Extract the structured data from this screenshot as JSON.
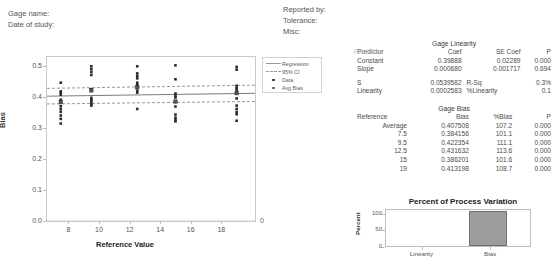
{
  "header": {
    "left": [
      "Gage name:",
      "Date of study:"
    ],
    "right": [
      "Reported by:",
      "Tolerance:",
      "Misc:"
    ]
  },
  "legend": {
    "items": [
      {
        "label": "Regression",
        "key": "solid-line"
      },
      {
        "label": "95% CI",
        "key": "dashed-line"
      },
      {
        "label": "Data",
        "key": "dot-marker"
      },
      {
        "label": "Avg Bias",
        "key": "square-marker"
      }
    ]
  },
  "linearity_table": {
    "title": "Gage Linearity",
    "headers": [
      "Predictor",
      "Coef",
      "SE Coef",
      "P"
    ],
    "rows": [
      [
        "Constant",
        "0.39888",
        "0.02289",
        "0.000"
      ],
      [
        "Slope",
        "0.000680",
        "0.001717",
        "0.694"
      ]
    ],
    "summary": [
      [
        "S",
        "0.0539582",
        "R-Sq",
        "0.3%"
      ],
      [
        "Linearity",
        "0.0002583",
        "%Linearity",
        "0.1"
      ]
    ]
  },
  "bias_table": {
    "title": "Gage Bias",
    "headers": [
      "Reference",
      "Bias",
      "%Bias",
      "P"
    ],
    "rows": [
      [
        "Average",
        "0.407508",
        "107.2",
        "0.000"
      ],
      [
        "7.5",
        "0.384156",
        "101.1",
        "0.000"
      ],
      [
        "9.5",
        "0.422354",
        "111.1",
        "0.000"
      ],
      [
        "12.5",
        "0.431632",
        "113.6",
        "0.000"
      ],
      [
        "15",
        "0.386201",
        "101.6",
        "0.000"
      ],
      [
        "19",
        "0.413198",
        "108.7",
        "0.000"
      ]
    ]
  },
  "chart_data": [
    {
      "type": "scatter",
      "title": "",
      "xlabel": "Reference Value",
      "ylabel": "Bias",
      "xlim": [
        6.6,
        20.2
      ],
      "ylim": [
        0.0,
        0.53
      ],
      "xticks": [
        8,
        10,
        12,
        14,
        16,
        18
      ],
      "yticks": [
        "0.0",
        "0.1",
        "0.2",
        "0.3",
        "0.4",
        "0.5"
      ],
      "grid": false,
      "zero_right_label": "0",
      "reference_zero_line": 0.0,
      "series": [
        {
          "name": "Data",
          "marker": "dot",
          "points": [
            [
              7.5,
              0.447
            ],
            [
              7.5,
              0.419
            ],
            [
              7.5,
              0.414
            ],
            [
              7.5,
              0.408
            ],
            [
              7.5,
              0.392
            ],
            [
              7.5,
              0.387
            ],
            [
              7.5,
              0.371
            ],
            [
              7.5,
              0.362
            ],
            [
              7.5,
              0.353
            ],
            [
              7.5,
              0.341
            ],
            [
              7.5,
              0.33
            ],
            [
              7.5,
              0.315
            ],
            [
              9.5,
              0.5
            ],
            [
              9.5,
              0.491
            ],
            [
              9.5,
              0.482
            ],
            [
              9.5,
              0.472
            ],
            [
              9.5,
              0.426
            ],
            [
              9.5,
              0.398
            ],
            [
              9.5,
              0.392
            ],
            [
              9.5,
              0.386
            ],
            [
              9.5,
              0.379
            ],
            [
              9.5,
              0.373
            ],
            [
              12.5,
              0.5
            ],
            [
              12.5,
              0.477
            ],
            [
              12.5,
              0.469
            ],
            [
              12.5,
              0.461
            ],
            [
              12.5,
              0.447
            ],
            [
              12.5,
              0.439
            ],
            [
              12.5,
              0.431
            ],
            [
              12.5,
              0.421
            ],
            [
              12.5,
              0.415
            ],
            [
              12.5,
              0.362
            ],
            [
              15,
              0.503
            ],
            [
              15,
              0.458
            ],
            [
              15,
              0.412
            ],
            [
              15,
              0.405
            ],
            [
              15,
              0.399
            ],
            [
              15,
              0.37
            ],
            [
              15,
              0.344
            ],
            [
              15,
              0.334
            ],
            [
              15,
              0.327
            ],
            [
              15,
              0.322
            ],
            [
              19,
              0.498
            ],
            [
              19,
              0.489
            ],
            [
              19,
              0.437
            ],
            [
              19,
              0.429
            ],
            [
              19,
              0.423
            ],
            [
              19,
              0.414
            ],
            [
              19,
              0.396
            ],
            [
              19,
              0.373
            ],
            [
              19,
              0.362
            ],
            [
              19,
              0.352
            ],
            [
              19,
              0.345
            ],
            [
              19,
              0.324
            ]
          ]
        },
        {
          "name": "Avg Bias",
          "marker": "square",
          "points": [
            [
              7.5,
              0.384
            ],
            [
              9.5,
              0.422
            ],
            [
              12.5,
              0.432
            ],
            [
              15,
              0.386
            ],
            [
              19,
              0.413
            ]
          ]
        }
      ],
      "lines": [
        {
          "name": "Regression",
          "style": "solid",
          "from": [
            6.6,
            0.4034
          ],
          "to": [
            20.2,
            0.4127
          ]
        },
        {
          "name": "95% CI Upper",
          "style": "dashed",
          "from": [
            6.6,
            0.4286
          ],
          "to": [
            20.2,
            0.439
          ]
        },
        {
          "name": "95% CI Lower",
          "style": "dashed",
          "from": [
            6.6,
            0.3782
          ],
          "to": [
            20.2,
            0.3864
          ]
        }
      ]
    },
    {
      "type": "bar",
      "title": "Percent of Process Variation",
      "xlabel": "",
      "ylabel": "Percent",
      "categories": [
        "Linearity",
        "Bias"
      ],
      "values": [
        0.1,
        107.2
      ],
      "yticks": [
        0,
        50,
        100
      ],
      "ylim": [
        0,
        115
      ],
      "grid": false,
      "bar_color": "#9d9d9d"
    }
  ]
}
